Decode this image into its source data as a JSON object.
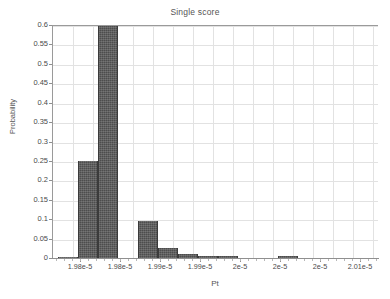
{
  "chart_data": {
    "type": "bar",
    "title": "Single score",
    "xlabel": "Pt",
    "ylabel": "Probability",
    "grid": true,
    "legend": null,
    "ylim": [
      0,
      0.6
    ],
    "ytick_labels": [
      "0",
      "0.05",
      "0.1",
      "0.15",
      "0.2",
      "0.25",
      "0.3",
      "0.35",
      "0.4",
      "0.45",
      "0.5",
      "0.55",
      "0.6"
    ],
    "ytick_values": [
      0,
      0.05,
      0.1,
      0.15,
      0.2,
      0.25,
      0.3,
      0.35,
      0.4,
      0.45,
      0.5,
      0.55,
      0.6
    ],
    "xtick_labels": [
      "1.98e-5",
      "1.98e-5",
      "1.99e-5",
      "1.99e-5",
      "2e-5",
      "2e-5",
      "2e-5",
      "2.01e-5"
    ],
    "xtick_positions": [
      80,
      120,
      160,
      200,
      240,
      280,
      320,
      360
    ],
    "categories": [
      "1.9800e-5",
      "1.9805e-5",
      "1.9810e-5",
      "1.9815e-5",
      "1.9820e-5",
      "1.9825e-5",
      "1.9830e-5",
      "1.9835e-5",
      "1.9840e-5",
      "1.9845e-5",
      "1.9850e-5",
      "1.9855e-5",
      "1.9860e-5",
      "1.9865e-5",
      "1.9870e-5",
      "1.9875e-5",
      "1.9880e-5"
    ],
    "values": [
      0.0,
      0.25,
      0.6,
      0.095,
      0.025,
      0.01,
      0.004,
      0.005,
      0.0,
      0.0,
      0.004,
      0.0,
      0.0,
      0.0,
      0.0,
      0.0,
      0.0
    ],
    "bars": [
      {
        "x_px": 57,
        "value": 0.002
      },
      {
        "x_px": 77,
        "value": 0.251
      },
      {
        "x_px": 97,
        "value": 0.6
      },
      {
        "x_px": 137,
        "value": 0.095
      },
      {
        "x_px": 157,
        "value": 0.026
      },
      {
        "x_px": 177,
        "value": 0.011
      },
      {
        "x_px": 197,
        "value": 0.004
      },
      {
        "x_px": 217,
        "value": 0.005
      },
      {
        "x_px": 277,
        "value": 0.004
      }
    ],
    "bar_color": "#4d4d4d",
    "grid_color": "#e2e2e2",
    "axis_color": "#8f8f8f",
    "background": "#ffffff"
  }
}
